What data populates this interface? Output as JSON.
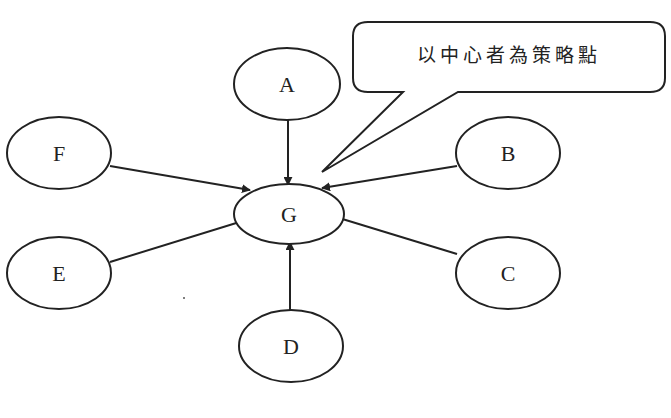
{
  "diagram": {
    "type": "hub-and-spoke",
    "center": {
      "id": "G",
      "label": "G"
    },
    "nodes": [
      {
        "id": "A",
        "label": "A"
      },
      {
        "id": "B",
        "label": "B"
      },
      {
        "id": "C",
        "label": "C"
      },
      {
        "id": "D",
        "label": "D"
      },
      {
        "id": "E",
        "label": "E"
      },
      {
        "id": "F",
        "label": "F"
      }
    ],
    "edges": [
      {
        "from": "A",
        "to": "G"
      },
      {
        "from": "B",
        "to": "G"
      },
      {
        "from": "C",
        "to": "G"
      },
      {
        "from": "D",
        "to": "G"
      },
      {
        "from": "E",
        "to": "G"
      },
      {
        "from": "F",
        "to": "G"
      }
    ],
    "callout": {
      "text": "以中心者為策略點",
      "points_to": "G"
    }
  },
  "colors": {
    "stroke": "#222222",
    "background": "#ffffff"
  }
}
